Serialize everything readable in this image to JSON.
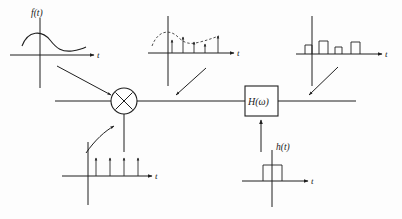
{
  "figure": {
    "background_color": "#fdfdfd",
    "ink_color": "#1f1f1f"
  },
  "labels": {
    "signal_ft": "f(t)",
    "impulse_ht": "h(t)",
    "filter_block": "H(ω)",
    "axis_t": "t"
  },
  "blocks": {
    "multiplier": {
      "name": "multiplier",
      "glyph": "×",
      "shape": "circle",
      "cx": 124,
      "cy": 101,
      "r": 13
    },
    "filter": {
      "name": "filter",
      "label": "H(ω)",
      "shape": "rect",
      "x": 245,
      "y": 86,
      "w": 33,
      "h": 30
    }
  },
  "signal_path": {
    "start_x": 55,
    "end_x": 356,
    "y": 101
  },
  "plots": [
    {
      "id": "input-signal",
      "name": "input-signal-plot",
      "label": "f(t)",
      "axis_label": "t",
      "type": "continuous",
      "origin": {
        "x": 40,
        "y": 55
      },
      "x_axis": {
        "x1": 10,
        "x2": 98
      },
      "y_axis": {
        "y1": 18,
        "y2": 88
      },
      "waveform_points": "hump then dip then level",
      "description": "smooth continuous-time waveform f(t)"
    },
    {
      "id": "sampled-signal",
      "name": "sampled-signal-plot",
      "label": "",
      "axis_label": "t",
      "type": "impulse-modulated",
      "origin": {
        "x": 168,
        "y": 53
      },
      "x_axis": {
        "x1": 148,
        "x2": 238
      },
      "y_axis": {
        "y1": 16,
        "y2": 86
      },
      "envelope": "dashed",
      "impulse_heights": [
        13,
        16,
        11,
        9,
        17
      ],
      "impulse_x": [
        172,
        183,
        194,
        205,
        218
      ],
      "description": "impulse-sampled signal with dashed envelope"
    },
    {
      "id": "pam-signal",
      "name": "pam-output-plot",
      "label": "",
      "axis_label": "t",
      "type": "pulse-amplitude",
      "origin": {
        "x": 312,
        "y": 54
      },
      "x_axis": {
        "x1": 296,
        "x2": 390
      },
      "y_axis": {
        "y1": 16,
        "y2": 86
      },
      "pulse_heights": [
        9,
        13,
        7,
        12
      ],
      "pulse_x": [
        306,
        320,
        336,
        352
      ],
      "pulse_width": 8,
      "description": "flat-top pulse amplitude modulated output"
    },
    {
      "id": "impulse-train",
      "name": "impulse-train-plot",
      "label": "",
      "axis_label": "t",
      "type": "impulse-train",
      "origin": {
        "x": 88,
        "y": 176
      },
      "x_axis": {
        "x1": 62,
        "x2": 155
      },
      "y_axis": {
        "y1": 142,
        "y2": 205
      },
      "impulse_heights": [
        18,
        18,
        18,
        18
      ],
      "impulse_x": [
        96,
        110,
        124,
        138
      ],
      "description": "periodic unit impulse train sampling function"
    },
    {
      "id": "pulse-shape",
      "name": "pulse-shape-plot",
      "label": "h(t)",
      "axis_label": "t",
      "type": "rect-pulse",
      "origin": {
        "x": 272,
        "y": 181
      },
      "x_axis": {
        "x1": 242,
        "x2": 322
      },
      "y_axis": {
        "y1": 150,
        "y2": 207
      },
      "pulse": {
        "x": 263,
        "w": 19,
        "h": 16
      },
      "description": "rectangular pulse impulse response h(t)"
    }
  ],
  "connectors": [
    {
      "name": "connector-input-to-path",
      "kind": "straight-arrow",
      "x1": 57,
      "x2": 113,
      "y1": 66,
      "y2": 97
    },
    {
      "name": "connector-sampled-to-path",
      "kind": "straight-arrow",
      "x1": 206,
      "x2": 175,
      "y1": 68,
      "y2": 97
    },
    {
      "name": "connector-pam-to-path",
      "kind": "straight-arrow",
      "x1": 338,
      "x2": 308,
      "y1": 67,
      "y2": 97
    },
    {
      "name": "connector-train-to-multiplier",
      "kind": "curved-arrow",
      "from": "impulse-train-plot",
      "to": "multiplier"
    },
    {
      "name": "connector-pulse-to-filter",
      "kind": "vertical-arrow",
      "from": "pulse-shape-plot",
      "to": "filter"
    }
  ]
}
